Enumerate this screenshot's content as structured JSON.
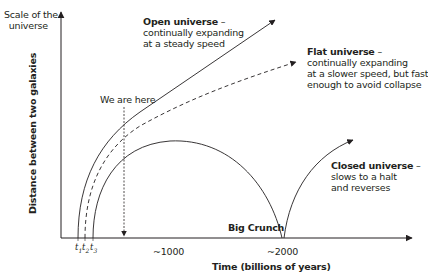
{
  "y_axis": {
    "top_label_line1": "Scale of the",
    "top_label_line2": "universe",
    "label": "Distance between two galaxies"
  },
  "x_axis": {
    "label": "Time (billions of years)",
    "ticks": [
      {
        "label": "t",
        "sub": "1"
      },
      {
        "label": "t",
        "sub": "2"
      },
      {
        "label": "t",
        "sub": "3"
      }
    ],
    "marks": [
      "~1000",
      "~2000"
    ]
  },
  "marker": {
    "we_are_here": "We are here"
  },
  "annotations": {
    "open": {
      "title": "Open universe",
      "dash": " –",
      "line1": "continually expanding",
      "line2": "at a steady speed"
    },
    "flat": {
      "title": "Flat universe",
      "dash": " –",
      "line1": "continually expanding",
      "line2": "at a slower speed, but fast",
      "line3": "enough to avoid collapse"
    },
    "closed": {
      "title": "Closed universe",
      "dash": " –",
      "line1": "slows to a halt",
      "line2": "and reverses"
    },
    "big_crunch": "Big Crunch"
  },
  "colors": {
    "ink": "#231f20",
    "background": "#ffffff"
  }
}
